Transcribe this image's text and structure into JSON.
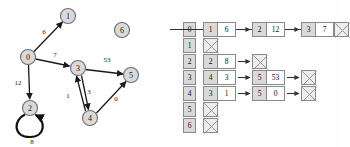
{
  "figure": {
    "panels": [
      "graph-diagram",
      "adjacency-list-table"
    ]
  },
  "graph": {
    "type": "weighted-directed-graph",
    "nodes": [
      {
        "id": "0",
        "label": "0",
        "cx": 28,
        "cy": 57,
        "r": 7.5
      },
      {
        "id": "1",
        "label": "1",
        "cx": 68,
        "cy": 16,
        "r": 7.5
      },
      {
        "id": "2",
        "label": "2",
        "cx": 30,
        "cy": 108,
        "r": 7.5
      },
      {
        "id": "3",
        "label": "3",
        "cx": 78,
        "cy": 68,
        "r": 7.5
      },
      {
        "id": "4",
        "label": "4",
        "cx": 90,
        "cy": 118,
        "r": 7.5
      },
      {
        "id": "5",
        "label": "5",
        "cx": 131,
        "cy": 75,
        "r": 7.5
      },
      {
        "id": "6",
        "label": "6",
        "cx": 122,
        "cy": 30,
        "r": 7.5
      }
    ],
    "edges": [
      {
        "from": "0",
        "to": "1",
        "weight": "6",
        "lx": 44,
        "ly": 32
      },
      {
        "from": "0",
        "to": "3",
        "weight": "7",
        "lx": 55,
        "ly": 55
      },
      {
        "from": "0",
        "to": "2",
        "weight": "12",
        "lx": 18,
        "ly": 83
      },
      {
        "from": "2",
        "to": "2",
        "weight": "8",
        "lx": 32,
        "ly": 142,
        "self_loop": true
      },
      {
        "from": "3",
        "to": "4",
        "weight": "3",
        "lx": 89,
        "ly": 92
      },
      {
        "from": "4",
        "to": "3",
        "weight": "1",
        "lx": 68,
        "ly": 96
      },
      {
        "from": "3",
        "to": "5",
        "weight": "53",
        "lx": 107,
        "ly": 60
      },
      {
        "from": "4",
        "to": "5",
        "weight": "0",
        "lx": 116,
        "ly": 99
      }
    ]
  },
  "adjacency_list": {
    "index_labels": [
      "0",
      "1",
      "2",
      "3",
      "4",
      "5",
      "6"
    ],
    "rows": [
      {
        "index": "0",
        "nodes": [
          {
            "key": "1",
            "value": "6"
          },
          {
            "key": "2",
            "value": "12"
          },
          {
            "key": "3",
            "value": "7"
          }
        ],
        "terminator": "null"
      },
      {
        "index": "1",
        "nodes": [],
        "terminator": "null"
      },
      {
        "index": "2",
        "nodes": [
          {
            "key": "2",
            "value": "8"
          }
        ],
        "terminator": "null"
      },
      {
        "index": "3",
        "nodes": [
          {
            "key": "4",
            "value": "3"
          },
          {
            "key": "5",
            "value": "53"
          }
        ],
        "terminator": "null"
      },
      {
        "index": "4",
        "nodes": [
          {
            "key": "3",
            "value": "1"
          },
          {
            "key": "5",
            "value": "0"
          }
        ],
        "terminator": "null"
      },
      {
        "index": "5",
        "nodes": [],
        "terminator": "null"
      },
      {
        "index": "6",
        "nodes": [],
        "terminator": "null"
      }
    ]
  },
  "colors": {
    "node_fill": "#d9d9d9",
    "node_stroke": "#6e6e6e",
    "edge_stroke": "#1a1a1a",
    "cell_key_fill": "#d9d9d9",
    "cell_value_fill": "#fdfdfd",
    "cell_border": "#8a8a8a",
    "null_fill": "#ededed",
    "background": "#ffffff"
  }
}
